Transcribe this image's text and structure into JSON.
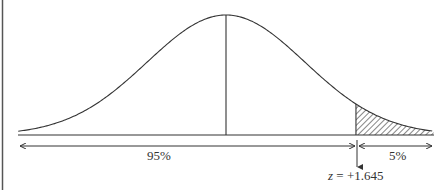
{
  "chart_data": {
    "type": "area",
    "title": "",
    "distribution": "normal",
    "mean": 0,
    "sd": 1,
    "critical_value": 1.645,
    "regions": [
      {
        "label": "95%",
        "from": "-inf",
        "to": 1.645,
        "shaded": false
      },
      {
        "label": "5%",
        "from": 1.645,
        "to": "inf",
        "shaded": true,
        "pattern": "hatched"
      }
    ],
    "annotations": [
      "95%",
      "5%",
      "z = +1.645"
    ],
    "xlabel": "",
    "ylabel": "",
    "grid": false,
    "legend": "none"
  },
  "labels": {
    "left_area": "95%",
    "right_area": "5%",
    "z_var": "z",
    "z_eq": "= +1.645"
  },
  "colors": {
    "line": "#333333",
    "background": "#ffffff"
  }
}
